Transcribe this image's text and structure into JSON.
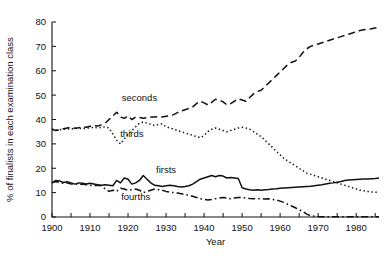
{
  "chart_data": {
    "type": "line",
    "title": "",
    "xlabel": "Year",
    "ylabel": "% of finalists in each examination class",
    "xlim": [
      1900,
      1986
    ],
    "ylim": [
      0,
      80
    ],
    "xticks": [
      1900,
      1910,
      1920,
      1930,
      1940,
      1950,
      1960,
      1970,
      1980
    ],
    "xticklabels": [
      "1900",
      "1910",
      "1920",
      "1930",
      "1940",
      "1950",
      "1960",
      "1970",
      "1980"
    ],
    "xminorstep": 5,
    "yticks": [
      0,
      10,
      20,
      30,
      40,
      50,
      60,
      70,
      80
    ],
    "yticklabels": [
      "0",
      "10",
      "20",
      "30",
      "40",
      "50",
      "60",
      "70",
      "80"
    ],
    "grid": false,
    "legend_position": "inline-annotations",
    "series": [
      {
        "name": "seconds",
        "style": "dashed",
        "label_x": 1923,
        "label_y": 47.5,
        "x": [
          1900,
          1901,
          1902,
          1903,
          1904,
          1905,
          1906,
          1907,
          1908,
          1909,
          1910,
          1911,
          1912,
          1913,
          1914,
          1915,
          1916,
          1917,
          1918,
          1919,
          1920,
          1921,
          1922,
          1923,
          1924,
          1925,
          1926,
          1927,
          1928,
          1929,
          1930,
          1931,
          1932,
          1933,
          1934,
          1935,
          1936,
          1937,
          1938,
          1939,
          1940,
          1941,
          1942,
          1943,
          1944,
          1945,
          1946,
          1947,
          1948,
          1949,
          1950,
          1951,
          1952,
          1953,
          1954,
          1955,
          1956,
          1957,
          1958,
          1959,
          1960,
          1961,
          1962,
          1963,
          1964,
          1965,
          1966,
          1967,
          1968,
          1969,
          1970,
          1971,
          1972,
          1973,
          1974,
          1975,
          1976,
          1977,
          1978,
          1979,
          1980,
          1981,
          1982,
          1983,
          1984,
          1985,
          1986
        ],
        "y": [
          36.0,
          35.5,
          35.8,
          36.2,
          36.5,
          36.8,
          36.4,
          36.6,
          37.0,
          36.8,
          37.2,
          37.5,
          37.3,
          37.8,
          38.5,
          40.0,
          41.5,
          43.0,
          41.0,
          40.5,
          41.5,
          40.0,
          41.0,
          40.8,
          40.5,
          40.8,
          41.0,
          41.0,
          41.2,
          41.0,
          41.3,
          41.5,
          42.0,
          42.8,
          43.5,
          44.0,
          44.5,
          45.2,
          46.5,
          47.5,
          46.8,
          46.0,
          47.0,
          48.3,
          48.0,
          47.2,
          46.0,
          46.5,
          47.5,
          48.5,
          48.0,
          47.5,
          49.0,
          50.5,
          51.5,
          52.0,
          53.5,
          55.0,
          56.5,
          58.0,
          59.5,
          61.0,
          62.5,
          63.5,
          64.0,
          65.5,
          67.5,
          69.0,
          70.0,
          70.5,
          71.0,
          71.5,
          72.0,
          72.5,
          73.0,
          73.5,
          74.0,
          74.5,
          75.0,
          75.5,
          76.0,
          76.5,
          76.8,
          77.0,
          77.2,
          77.5,
          77.8
        ]
      },
      {
        "name": "thirds",
        "style": "dotted",
        "label_x": 1921,
        "label_y": 33.0,
        "x": [
          1900,
          1901,
          1902,
          1903,
          1904,
          1905,
          1906,
          1907,
          1908,
          1909,
          1910,
          1911,
          1912,
          1913,
          1914,
          1915,
          1916,
          1917,
          1918,
          1919,
          1920,
          1921,
          1922,
          1923,
          1924,
          1925,
          1926,
          1927,
          1928,
          1929,
          1930,
          1931,
          1932,
          1933,
          1934,
          1935,
          1936,
          1937,
          1938,
          1939,
          1940,
          1941,
          1942,
          1943,
          1944,
          1945,
          1946,
          1947,
          1948,
          1949,
          1950,
          1951,
          1952,
          1953,
          1954,
          1955,
          1956,
          1957,
          1958,
          1959,
          1960,
          1961,
          1962,
          1963,
          1964,
          1965,
          1966,
          1967,
          1968,
          1969,
          1970,
          1971,
          1972,
          1973,
          1974,
          1975,
          1976,
          1977,
          1978,
          1979,
          1980,
          1981,
          1982,
          1983,
          1984,
          1985,
          1986
        ],
        "y": [
          36.0,
          35.6,
          35.8,
          36.0,
          36.2,
          36.0,
          36.3,
          36.5,
          36.2,
          36.4,
          36.6,
          36.8,
          36.5,
          36.8,
          37.0,
          36.5,
          34.0,
          31.5,
          30.0,
          32.0,
          34.0,
          35.5,
          37.0,
          38.5,
          39.0,
          38.5,
          38.0,
          37.5,
          38.0,
          38.2,
          37.0,
          36.5,
          36.0,
          35.5,
          35.0,
          34.5,
          34.0,
          33.5,
          33.0,
          32.5,
          33.5,
          35.0,
          36.0,
          36.5,
          36.0,
          35.5,
          35.0,
          35.5,
          36.0,
          36.5,
          36.8,
          36.5,
          36.0,
          35.0,
          34.0,
          33.0,
          31.5,
          30.0,
          28.5,
          27.0,
          25.5,
          24.0,
          23.0,
          22.0,
          21.0,
          20.0,
          19.0,
          18.0,
          17.5,
          17.0,
          16.5,
          16.0,
          15.5,
          15.0,
          14.5,
          14.0,
          13.5,
          13.0,
          12.5,
          12.0,
          11.5,
          11.0,
          10.8,
          10.5,
          10.3,
          10.2,
          10.0
        ]
      },
      {
        "name": "firsts",
        "style": "solid",
        "label_x": 1930,
        "label_y": 18.0,
        "x": [
          1900,
          1901,
          1902,
          1903,
          1904,
          1905,
          1906,
          1907,
          1908,
          1909,
          1910,
          1911,
          1912,
          1913,
          1914,
          1915,
          1916,
          1917,
          1918,
          1919,
          1920,
          1921,
          1922,
          1923,
          1924,
          1925,
          1926,
          1927,
          1928,
          1929,
          1930,
          1931,
          1932,
          1933,
          1934,
          1935,
          1936,
          1937,
          1938,
          1939,
          1940,
          1941,
          1942,
          1943,
          1944,
          1945,
          1946,
          1947,
          1948,
          1949,
          1950,
          1951,
          1952,
          1953,
          1954,
          1955,
          1956,
          1957,
          1958,
          1959,
          1960,
          1961,
          1962,
          1963,
          1964,
          1965,
          1966,
          1967,
          1968,
          1969,
          1970,
          1971,
          1972,
          1973,
          1974,
          1975,
          1976,
          1977,
          1978,
          1979,
          1980,
          1981,
          1982,
          1983,
          1984,
          1985,
          1986
        ],
        "y": [
          14.0,
          15.0,
          14.8,
          14.2,
          14.5,
          14.0,
          13.5,
          14.0,
          13.8,
          13.5,
          13.8,
          13.5,
          13.2,
          13.0,
          13.2,
          13.0,
          12.8,
          15.0,
          14.0,
          16.0,
          15.5,
          13.5,
          14.0,
          15.0,
          17.0,
          15.5,
          14.0,
          13.0,
          12.8,
          12.5,
          12.8,
          13.0,
          12.8,
          12.5,
          12.3,
          12.5,
          12.8,
          13.5,
          14.5,
          15.5,
          16.0,
          16.5,
          17.0,
          16.5,
          17.0,
          16.8,
          16.0,
          16.2,
          16.0,
          15.8,
          12.0,
          11.5,
          11.2,
          11.0,
          11.2,
          11.0,
          11.2,
          11.3,
          11.5,
          11.6,
          11.8,
          11.9,
          12.0,
          12.1,
          12.2,
          12.3,
          12.4,
          12.5,
          12.6,
          12.8,
          13.0,
          13.2,
          13.5,
          13.8,
          14.0,
          14.3,
          14.6,
          15.0,
          15.2,
          15.3,
          15.4,
          15.5,
          15.6,
          15.6,
          15.7,
          15.8,
          16.0
        ]
      },
      {
        "name": "fourths",
        "style": "dashdot",
        "label_x": 1922,
        "label_y": 7.0,
        "x": [
          1900,
          1901,
          1902,
          1903,
          1904,
          1905,
          1906,
          1907,
          1908,
          1909,
          1910,
          1911,
          1912,
          1913,
          1914,
          1915,
          1916,
          1917,
          1918,
          1919,
          1920,
          1921,
          1922,
          1923,
          1924,
          1925,
          1926,
          1927,
          1928,
          1929,
          1930,
          1931,
          1932,
          1933,
          1934,
          1935,
          1936,
          1937,
          1938,
          1939,
          1940,
          1941,
          1942,
          1943,
          1944,
          1945,
          1946,
          1947,
          1948,
          1949,
          1950,
          1951,
          1952,
          1953,
          1954,
          1955,
          1956,
          1957,
          1958,
          1959,
          1960,
          1961,
          1962,
          1963,
          1964,
          1965,
          1966,
          1967,
          1968,
          1969,
          1970,
          1971,
          1972,
          1973,
          1974,
          1975,
          1976,
          1977,
          1978,
          1979,
          1980,
          1981,
          1982,
          1983,
          1984,
          1985,
          1986
        ],
        "y": [
          14.0,
          14.5,
          14.2,
          13.8,
          14.0,
          13.5,
          13.8,
          13.2,
          13.5,
          13.2,
          13.0,
          12.8,
          13.0,
          12.8,
          11.5,
          10.5,
          11.0,
          10.5,
          11.8,
          11.5,
          11.0,
          11.2,
          11.5,
          11.0,
          10.0,
          10.5,
          11.0,
          11.5,
          11.2,
          11.0,
          10.5,
          10.2,
          10.0,
          9.8,
          9.5,
          9.2,
          9.0,
          8.5,
          8.0,
          7.5,
          7.2,
          7.0,
          7.2,
          7.5,
          7.8,
          8.0,
          7.8,
          7.5,
          7.8,
          8.0,
          8.0,
          7.8,
          7.6,
          7.5,
          7.6,
          7.5,
          7.4,
          7.5,
          7.2,
          7.0,
          6.5,
          6.0,
          5.2,
          4.5,
          3.8,
          3.0,
          2.2,
          1.2,
          0.5,
          0.3,
          0.2,
          0.15,
          0.1,
          0.1,
          0.1,
          0.1,
          0.1,
          0.1,
          0.1,
          0.1,
          0.1,
          0.1,
          0.1,
          0.1,
          0.1,
          0.1,
          0.1
        ]
      }
    ]
  }
}
